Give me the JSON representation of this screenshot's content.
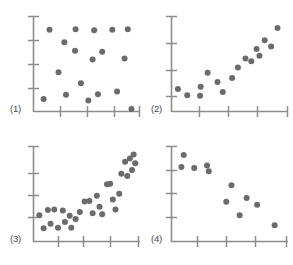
{
  "figure": {
    "title": "",
    "panel_count": 4,
    "marker_color": "#6b6b6b",
    "axis_color": "#8d8d8d",
    "background_color": "#ffffff",
    "marker_radius": 3.0
  },
  "chart_data": [
    {
      "type": "scatter",
      "title": "(1)",
      "label": "(1)",
      "description": "no correlation / random scatter",
      "xlabel": "",
      "ylabel": "",
      "xlim": [
        0,
        10
      ],
      "ylim": [
        0,
        10
      ],
      "grid": false,
      "legend": null,
      "x_ticks": [
        2.5,
        5.0,
        7.5,
        10.0
      ],
      "y_ticks": [
        2.5,
        5.0,
        7.5,
        10.0
      ],
      "x_tick_labels": [
        "",
        "",
        "",
        ""
      ],
      "y_tick_labels": [
        "",
        "",
        "",
        ""
      ],
      "points": [
        [
          1.5,
          8.55
        ],
        [
          3.95,
          8.6
        ],
        [
          5.7,
          8.5
        ],
        [
          7.4,
          8.55
        ],
        [
          8.85,
          8.6
        ],
        [
          2.9,
          7.25
        ],
        [
          3.9,
          6.35
        ],
        [
          6.45,
          6.25
        ],
        [
          5.55,
          5.45
        ],
        [
          8.55,
          5.55
        ],
        [
          2.35,
          4.1
        ],
        [
          4.45,
          2.95
        ],
        [
          3.05,
          1.75
        ],
        [
          6.05,
          1.8
        ],
        [
          7.85,
          2.1
        ],
        [
          0.95,
          1.3
        ],
        [
          5.15,
          1.15
        ],
        [
          9.2,
          0.25
        ]
      ]
    },
    {
      "type": "scatter",
      "title": "(2)",
      "label": "(2)",
      "description": "strong positive linear correlation",
      "xlabel": "",
      "ylabel": "",
      "xlim": [
        0,
        10
      ],
      "ylim": [
        0,
        10
      ],
      "grid": false,
      "legend": null,
      "x_ticks": [
        2.5,
        5.0,
        7.5,
        10.0
      ],
      "y_ticks": [
        5.0,
        10.0
      ],
      "x_tick_labels": [
        "",
        "",
        "",
        ""
      ],
      "y_tick_labels": [
        "",
        ""
      ],
      "points": [
        [
          0.55,
          2.35
        ],
        [
          1.35,
          1.7
        ],
        [
          2.45,
          1.65
        ],
        [
          2.5,
          2.6
        ],
        [
          3.1,
          4.05
        ],
        [
          3.95,
          3.1
        ],
        [
          4.4,
          2.05
        ],
        [
          5.2,
          3.5
        ],
        [
          5.7,
          4.6
        ],
        [
          6.35,
          5.55
        ],
        [
          6.85,
          5.25
        ],
        [
          7.3,
          6.55
        ],
        [
          7.55,
          5.85
        ],
        [
          8.0,
          7.45
        ],
        [
          8.55,
          6.8
        ],
        [
          9.1,
          8.75
        ]
      ]
    },
    {
      "type": "scatter",
      "title": "(3)",
      "label": "(3)",
      "description": "curved / exponential positive relationship with scatter",
      "xlabel": "",
      "ylabel": "",
      "xlim": [
        0,
        10
      ],
      "ylim": [
        0,
        10
      ],
      "grid": false,
      "legend": null,
      "x_ticks": [
        2.0,
        4.0,
        6.5,
        9.5
      ],
      "y_ticks": [
        3.0,
        6.0,
        9.0
      ],
      "x_tick_labels": [
        "",
        "",
        "",
        ""
      ],
      "y_tick_labels": [
        "",
        "",
        ""
      ],
      "points": [
        [
          0.55,
          2.75
        ],
        [
          0.95,
          1.4
        ],
        [
          1.35,
          3.3
        ],
        [
          1.6,
          1.85
        ],
        [
          1.95,
          3.35
        ],
        [
          2.3,
          1.45
        ],
        [
          2.75,
          3.25
        ],
        [
          2.95,
          2.05
        ],
        [
          3.4,
          2.7
        ],
        [
          3.55,
          1.45
        ],
        [
          3.95,
          2.35
        ],
        [
          4.35,
          3.1
        ],
        [
          4.8,
          4.2
        ],
        [
          5.25,
          4.25
        ],
        [
          5.55,
          2.95
        ],
        [
          5.95,
          4.8
        ],
        [
          6.2,
          3.65
        ],
        [
          6.45,
          2.85
        ],
        [
          6.9,
          6.0
        ],
        [
          7.2,
          6.05
        ],
        [
          7.45,
          4.4
        ],
        [
          7.7,
          3.35
        ],
        [
          8.05,
          5.0
        ],
        [
          8.25,
          7.1
        ],
        [
          8.6,
          8.35
        ],
        [
          8.8,
          6.85
        ],
        [
          9.05,
          8.7
        ],
        [
          9.25,
          7.5
        ],
        [
          9.4,
          9.1
        ],
        [
          9.55,
          8.2
        ]
      ]
    },
    {
      "type": "scatter",
      "title": "(4)",
      "label": "(4)",
      "description": "negative correlation",
      "xlabel": "",
      "ylabel": "",
      "xlim": [
        0,
        10
      ],
      "ylim": [
        0,
        10
      ],
      "grid": false,
      "legend": null,
      "x_ticks": [
        2.0,
        4.5,
        7.0,
        9.5
      ],
      "y_ticks": [
        2.5,
        5.5,
        8.0,
        9.8
      ],
      "x_tick_labels": [
        "",
        "",
        "",
        ""
      ],
      "y_tick_labels": [
        "",
        "",
        "",
        ""
      ],
      "points": [
        [
          1.05,
          9.05
        ],
        [
          0.85,
          7.8
        ],
        [
          1.95,
          7.7
        ],
        [
          3.05,
          7.95
        ],
        [
          3.2,
          7.35
        ],
        [
          5.15,
          5.9
        ],
        [
          4.7,
          4.15
        ],
        [
          6.45,
          4.55
        ],
        [
          7.35,
          3.85
        ],
        [
          5.85,
          2.75
        ],
        [
          8.85,
          1.7
        ]
      ]
    }
  ]
}
